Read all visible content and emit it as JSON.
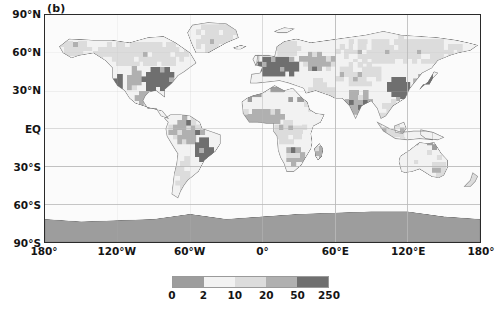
{
  "figure": {
    "panel_label": "(b)",
    "projection": "equirectangular",
    "lon_range": [
      -180,
      180
    ],
    "lat_range": [
      -90,
      90
    ]
  },
  "axes": {
    "y_ticks": [
      {
        "label": "90°N",
        "value": 90
      },
      {
        "label": "60°N",
        "value": 60
      },
      {
        "label": "30°N",
        "value": 30
      },
      {
        "label": "EQ",
        "value": 0
      },
      {
        "label": "30°S",
        "value": -30
      },
      {
        "label": "60°S",
        "value": -60
      },
      {
        "label": "90°S",
        "value": -90
      }
    ],
    "x_ticks": [
      {
        "label": "180°",
        "value": -180
      },
      {
        "label": "120°W",
        "value": -120
      },
      {
        "label": "60°W",
        "value": -60
      },
      {
        "label": "0°",
        "value": 0
      },
      {
        "label": "60°E",
        "value": 60
      },
      {
        "label": "120°E",
        "value": 120
      },
      {
        "label": "180°",
        "value": 180
      }
    ]
  },
  "colorbar": {
    "orientation": "horizontal",
    "boundaries": [
      0,
      2,
      10,
      20,
      50,
      250
    ],
    "tick_labels": [
      "0",
      "2",
      "10",
      "20",
      "50",
      "250"
    ],
    "swatch_colors": [
      "#9d9d9d",
      "#f2f2f2",
      "#dcdcdc",
      "#b0b0b0",
      "#6f6f6f"
    ]
  },
  "chart_data": {
    "type": "heatmap",
    "title": "(b)",
    "xlabel": "",
    "ylabel": "",
    "xlim": [
      -180,
      180
    ],
    "ylim": [
      -90,
      90
    ],
    "grid": true,
    "legend_position": "bottom",
    "colorbar_levels": [
      0,
      2,
      10,
      20,
      50,
      250
    ],
    "colorbar_labels": [
      "0",
      "2",
      "10",
      "20",
      "50",
      "250"
    ],
    "level_colors": [
      "#9d9d9d",
      "#f2f2f2",
      "#dcdcdc",
      "#b0b0b0",
      "#6f6f6f"
    ],
    "ocean_color": "#fbfbfb",
    "grid_color": "#b9b9b9",
    "coast_color": "#7d7d7d",
    "cell_size_deg": [
      3.75,
      3.75
    ],
    "regions": [
      {
        "name": "eastern-united-states",
        "level": 4,
        "value_range": [
          50,
          250
        ],
        "lon": [
          -100,
          -72
        ],
        "lat": [
          30,
          49
        ]
      },
      {
        "name": "central-united-states",
        "level": 3,
        "value_range": [
          20,
          50
        ],
        "lon": [
          -112,
          -100
        ],
        "lat": [
          31,
          49
        ]
      },
      {
        "name": "western-us-coast",
        "level": 4,
        "value_range": [
          50,
          250
        ],
        "lon": [
          -124,
          -116
        ],
        "lat": [
          32,
          42
        ]
      },
      {
        "name": "mexico-central-america",
        "level": 3,
        "value_range": [
          20,
          50
        ],
        "lon": [
          -106,
          -88
        ],
        "lat": [
          15,
          30
        ]
      },
      {
        "name": "canada-boreal",
        "level": 2,
        "value_range": [
          10,
          20
        ],
        "lon": [
          -140,
          -60
        ],
        "lat": [
          50,
          70
        ]
      },
      {
        "name": "alaska",
        "level": 2,
        "value_range": [
          10,
          20
        ],
        "lon": [
          -168,
          -140
        ],
        "lat": [
          58,
          71
        ]
      },
      {
        "name": "greenland",
        "level": 2,
        "value_range": [
          10,
          20
        ],
        "lon": [
          -55,
          -20
        ],
        "lat": [
          60,
          84
        ]
      },
      {
        "name": "northern-south-america",
        "level": 3,
        "value_range": [
          20,
          50
        ],
        "lon": [
          -78,
          -50
        ],
        "lat": [
          -12,
          10
        ]
      },
      {
        "name": "brazil-southeast",
        "level": 4,
        "value_range": [
          50,
          250
        ],
        "lon": [
          -56,
          -40
        ],
        "lat": [
          -26,
          -8
        ]
      },
      {
        "name": "andes-argentina",
        "level": 2,
        "value_range": [
          10,
          20
        ],
        "lon": [
          -72,
          -58
        ],
        "lat": [
          -52,
          -22
        ]
      },
      {
        "name": "western-europe",
        "level": 4,
        "value_range": [
          50,
          250
        ],
        "lon": [
          -8,
          30
        ],
        "lat": [
          42,
          58
        ]
      },
      {
        "name": "eastern-europe-russia",
        "level": 3,
        "value_range": [
          20,
          50
        ],
        "lon": [
          30,
          60
        ],
        "lat": [
          46,
          60
        ]
      },
      {
        "name": "scandinavia",
        "level": 2,
        "value_range": [
          10,
          20
        ],
        "lon": [
          5,
          32
        ],
        "lat": [
          58,
          70
        ]
      },
      {
        "name": "siberia",
        "level": 2,
        "value_range": [
          10,
          20
        ],
        "lon": [
          60,
          170
        ],
        "lat": [
          52,
          72
        ]
      },
      {
        "name": "north-africa-sahara",
        "level": 1,
        "value_range": [
          2,
          10
        ],
        "lon": [
          -16,
          34
        ],
        "lat": [
          18,
          32
        ]
      },
      {
        "name": "sahel-west-africa",
        "level": 3,
        "value_range": [
          20,
          50
        ],
        "lon": [
          -16,
          18
        ],
        "lat": [
          4,
          16
        ]
      },
      {
        "name": "central-africa",
        "level": 2,
        "value_range": [
          10,
          20
        ],
        "lon": [
          10,
          36
        ],
        "lat": [
          -12,
          6
        ]
      },
      {
        "name": "southern-africa",
        "level": 3,
        "value_range": [
          20,
          50
        ],
        "lon": [
          16,
          34
        ],
        "lat": [
          -30,
          -14
        ]
      },
      {
        "name": "madagascar",
        "level": 3,
        "value_range": [
          20,
          50
        ],
        "lon": [
          43,
          50
        ],
        "lat": [
          -25,
          -12
        ]
      },
      {
        "name": "middle-east",
        "level": 2,
        "value_range": [
          10,
          20
        ],
        "lon": [
          34,
          60
        ],
        "lat": [
          14,
          38
        ]
      },
      {
        "name": "india",
        "level": 3,
        "value_range": [
          20,
          50
        ],
        "lon": [
          68,
          90
        ],
        "lat": [
          8,
          30
        ]
      },
      {
        "name": "eastern-china",
        "level": 4,
        "value_range": [
          50,
          250
        ],
        "lon": [
          103,
          123
        ],
        "lat": [
          22,
          42
        ]
      },
      {
        "name": "japan-korea",
        "level": 4,
        "value_range": [
          50,
          250
        ],
        "lon": [
          125,
          142
        ],
        "lat": [
          32,
          44
        ]
      },
      {
        "name": "southeast-asia",
        "level": 2,
        "value_range": [
          10,
          20
        ],
        "lon": [
          95,
          125
        ],
        "lat": [
          -10,
          22
        ]
      },
      {
        "name": "central-asia",
        "level": 2,
        "value_range": [
          10,
          20
        ],
        "lon": [
          60,
          100
        ],
        "lat": [
          34,
          52
        ]
      },
      {
        "name": "australia",
        "level": 1,
        "value_range": [
          2,
          10
        ],
        "lon": [
          114,
          153
        ],
        "lat": [
          -39,
          -11
        ]
      },
      {
        "name": "australia-southeast",
        "level": 2,
        "value_range": [
          10,
          20
        ],
        "lon": [
          140,
          153
        ],
        "lat": [
          -38,
          -26
        ]
      },
      {
        "name": "new-zealand",
        "level": 2,
        "value_range": [
          10,
          20
        ],
        "lon": [
          166,
          178
        ],
        "lat": [
          -47,
          -34
        ]
      },
      {
        "name": "antarctica",
        "level": 0,
        "value_range": [
          0,
          2
        ],
        "lon": [
          -180,
          180
        ],
        "lat": [
          -90,
          -65
        ]
      }
    ]
  }
}
